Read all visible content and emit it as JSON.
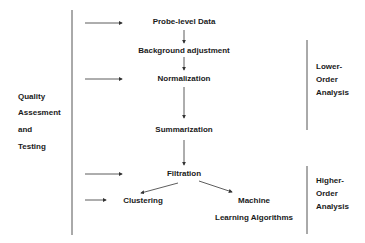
{
  "diagram": {
    "steps": {
      "probe": "Probe-level Data",
      "background": "Background adjustment",
      "normalization": "Normalization",
      "summarization": "Summarization",
      "filtration": "Filtration",
      "clustering": "Clustering",
      "machine_1": "Machine",
      "machine_2": "Learning Algorithms"
    },
    "left_group": [
      "Quality",
      "Assesment",
      "and",
      "Testing"
    ],
    "lower_group": [
      "Lower-",
      "Order",
      "Analysis"
    ],
    "higher_group": [
      "Higher-",
      "Order",
      "Analysis"
    ]
  },
  "colors": {
    "line": "#444444",
    "text": "#1a1a1a"
  }
}
